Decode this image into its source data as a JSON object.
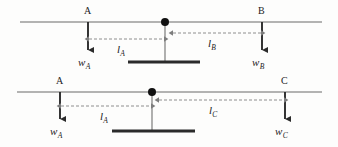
{
  "figure": {
    "colors": {
      "beam": "#9a9a9a",
      "force_arrow": "#2b2b2b",
      "dimension_line": "#8e8e8e",
      "pivot_dot": "#111111",
      "fulcrum_base": "#2b2b2b",
      "fulcrum_stem": "#8e8e8e",
      "background": "#fdfdfc",
      "text": "#1c1c1c"
    },
    "diagrams": [
      {
        "id": "diagram-top",
        "name": "two-load-lever-A-B",
        "beam": {
          "x1": 20,
          "x2": 322,
          "y": 22
        },
        "pivot": {
          "x": 165,
          "y": 22,
          "radius": 4
        },
        "fulcrum": {
          "stem": {
            "x": 165,
            "y1": 22,
            "y2": 62
          },
          "base": {
            "x1": 128,
            "x2": 200,
            "y": 62,
            "thickness": 3
          }
        },
        "loads": [
          {
            "point_label": "A",
            "point_label_x": 84,
            "point_label_y": 6,
            "arrow_x": 88,
            "arrow_y1": 22,
            "arrow_y2": 55,
            "force_label": "w",
            "force_subscript": "A",
            "force_label_x": 78,
            "force_label_y": 57
          },
          {
            "point_label": "B",
            "point_label_x": 258,
            "point_label_y": 6,
            "arrow_x": 262,
            "arrow_y1": 22,
            "arrow_y2": 55,
            "force_label": "w",
            "force_subscript": "B",
            "force_label_x": 252,
            "force_label_y": 57
          }
        ],
        "dimensions": [
          {
            "label": "l",
            "subscript": "A",
            "x1": 88,
            "x2": 165,
            "y": 39,
            "label_x": 117,
            "label_y": 44
          },
          {
            "label": "l",
            "subscript": "B",
            "x1": 172,
            "x2": 262,
            "y": 33,
            "label_x": 208,
            "label_y": 38
          }
        ]
      },
      {
        "id": "diagram-bottom",
        "name": "two-load-lever-A-C",
        "beam": {
          "x1": 17,
          "x2": 322,
          "y": 22
        },
        "pivot": {
          "x": 152,
          "y": 22,
          "radius": 4
        },
        "fulcrum": {
          "stem": {
            "x": 152,
            "y1": 22,
            "y2": 61
          },
          "base": {
            "x1": 112,
            "x2": 195,
            "y": 61,
            "thickness": 3
          }
        },
        "loads": [
          {
            "point_label": "A",
            "point_label_x": 56,
            "point_label_y": 6,
            "arrow_x": 60,
            "arrow_y1": 22,
            "arrow_y2": 54,
            "force_label": "w",
            "force_subscript": "A",
            "force_label_x": 50,
            "force_label_y": 56
          },
          {
            "point_label": "C",
            "point_label_x": 281,
            "point_label_y": 6,
            "arrow_x": 285,
            "arrow_y1": 22,
            "arrow_y2": 54,
            "force_label": "w",
            "force_subscript": "C",
            "force_label_x": 275,
            "force_label_y": 56
          }
        ],
        "dimensions": [
          {
            "label": "l",
            "subscript": "A",
            "x1": 60,
            "x2": 152,
            "y": 36,
            "label_x": 100,
            "label_y": 41
          },
          {
            "label": "l",
            "subscript": "C",
            "x1": 158,
            "x2": 285,
            "y": 30,
            "label_x": 209,
            "label_y": 35
          }
        ]
      }
    ]
  }
}
